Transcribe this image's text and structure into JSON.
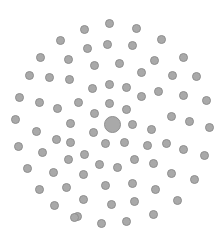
{
  "diagram": {
    "type": "phyllotaxis-dot-pattern",
    "background": "#ffffff",
    "dot_fill": "#a9a9a9",
    "dot_stroke": "#8f8f8f",
    "center": {
      "x": 112,
      "y": 124,
      "r": 8.5
    },
    "dot_radius": 4.5,
    "dots": [
      [
        109,
        23
      ],
      [
        84,
        29
      ],
      [
        136,
        28
      ],
      [
        60,
        40
      ],
      [
        161,
        39
      ],
      [
        107,
        44
      ],
      [
        132,
        45
      ],
      [
        87,
        48
      ],
      [
        40,
        57
      ],
      [
        68,
        59
      ],
      [
        154,
        60
      ],
      [
        183,
        57
      ],
      [
        119,
        63
      ],
      [
        94,
        65
      ],
      [
        141,
        72
      ],
      [
        29,
        75
      ],
      [
        49,
        77
      ],
      [
        69,
        79
      ],
      [
        172,
        75
      ],
      [
        196,
        76
      ],
      [
        109,
        84
      ],
      [
        92,
        88
      ],
      [
        126,
        87
      ],
      [
        158,
        91
      ],
      [
        141,
        96
      ],
      [
        183,
        95
      ],
      [
        19,
        97
      ],
      [
        39,
        102
      ],
      [
        78,
        102
      ],
      [
        109,
        103
      ],
      [
        206,
        100
      ],
      [
        57,
        108
      ],
      [
        126,
        109
      ],
      [
        94,
        113
      ],
      [
        171,
        116
      ],
      [
        15,
        119
      ],
      [
        70,
        123
      ],
      [
        132,
        124
      ],
      [
        189,
        121
      ],
      [
        209,
        127
      ],
      [
        151,
        129
      ],
      [
        36,
        131
      ],
      [
        93,
        132
      ],
      [
        56,
        139
      ],
      [
        18,
        146
      ],
      [
        70,
        142
      ],
      [
        105,
        143
      ],
      [
        124,
        142
      ],
      [
        147,
        145
      ],
      [
        166,
        143
      ],
      [
        42,
        152
      ],
      [
        84,
        154
      ],
      [
        183,
        149
      ],
      [
        204,
        155
      ],
      [
        68,
        159
      ],
      [
        134,
        159
      ],
      [
        99,
        164
      ],
      [
        117,
        167
      ],
      [
        153,
        163
      ],
      [
        27,
        168
      ],
      [
        53,
        172
      ],
      [
        83,
        174
      ],
      [
        171,
        173
      ],
      [
        194,
        179
      ],
      [
        132,
        183
      ],
      [
        105,
        185
      ],
      [
        39,
        189
      ],
      [
        66,
        187
      ],
      [
        155,
        189
      ],
      [
        83,
        199
      ],
      [
        111,
        204
      ],
      [
        134,
        201
      ],
      [
        177,
        200
      ],
      [
        54,
        205
      ],
      [
        77,
        216
      ],
      [
        101,
        223
      ],
      [
        126,
        221
      ],
      [
        153,
        214
      ],
      [
        74,
        217
      ]
    ]
  }
}
